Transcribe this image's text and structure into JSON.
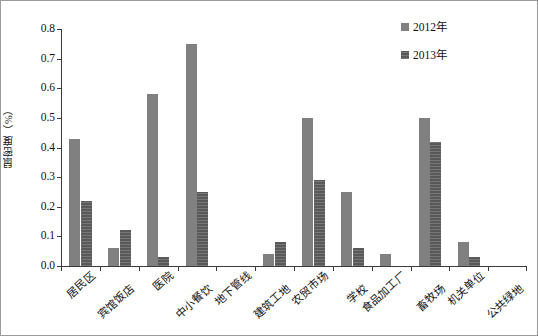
{
  "chart_data": {
    "type": "bar",
    "title": "",
    "subtitle": "",
    "xlabel": "",
    "ylabel": "鼠密度（%）",
    "ylim": [
      0,
      0.8
    ],
    "ytick_labels": [
      "0.0",
      "0.1",
      "0.2",
      "0.3",
      "0.4",
      "0.5",
      "0.6",
      "0.7",
      "0.8"
    ],
    "ytick_values": [
      0.0,
      0.1,
      0.2,
      0.3,
      0.4,
      0.5,
      0.6,
      0.7,
      0.8
    ],
    "grid": false,
    "legend_position": "top-right",
    "categories": [
      "居民区",
      "宾馆饭店",
      "医院",
      "中小餐饮",
      "地下管线",
      "建筑工地",
      "农贸市场",
      "学校",
      "食品加工厂",
      "畜牧场",
      "机关单位",
      "公共绿地"
    ],
    "series": [
      {
        "name": "2012年",
        "color": "#808080",
        "values": [
          0.43,
          0.06,
          0.58,
          0.75,
          0.0,
          0.04,
          0.5,
          0.25,
          0.04,
          0.5,
          0.08,
          0.0
        ]
      },
      {
        "name": "2013年",
        "color": "#595959",
        "values": [
          0.22,
          0.12,
          0.03,
          0.25,
          0.0,
          0.08,
          0.29,
          0.06,
          0.0,
          0.42,
          0.03,
          0.0
        ]
      }
    ]
  },
  "legend": {
    "items": [
      {
        "label": "2012年",
        "swatch": "legend-swatch-2012"
      },
      {
        "label": "2013年",
        "swatch": "legend-swatch-2013"
      }
    ]
  }
}
